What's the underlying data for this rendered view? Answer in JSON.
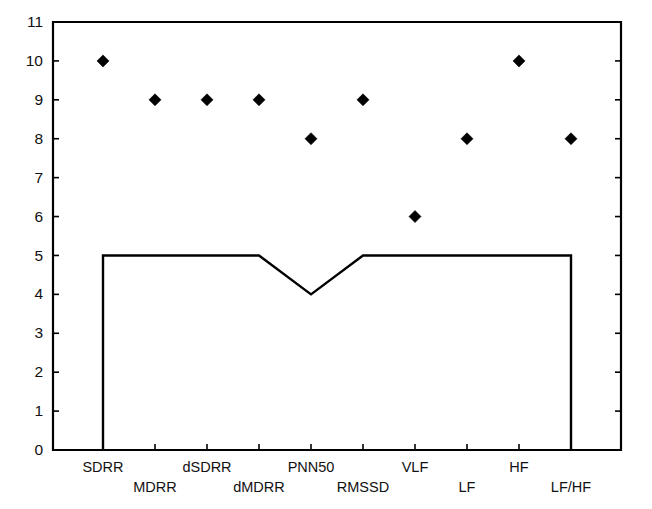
{
  "chart_data": {
    "type": "scatter",
    "title": "",
    "xlabel": "",
    "ylabel": "",
    "ylim": [
      0,
      11
    ],
    "yticks": [
      0,
      1,
      2,
      3,
      4,
      5,
      6,
      7,
      8,
      9,
      10,
      11
    ],
    "ytick_labels": [
      "0",
      "1",
      "2",
      "3",
      "4",
      "5",
      "6",
      "7",
      "8",
      "9",
      "10",
      "11"
    ],
    "grid": false,
    "legend": "none",
    "categories": [
      "SDRR",
      "MDRR",
      "dSDRR",
      "dMDRR",
      "PNN50",
      "RMSSD",
      "VLF",
      "LF",
      "HF",
      "LF/HF"
    ],
    "series": [
      {
        "name": "markers",
        "marker": "diamond",
        "color": "#000000",
        "values": [
          10,
          9,
          9,
          9,
          8,
          9,
          6,
          8,
          10,
          8
        ]
      },
      {
        "name": "threshold-step",
        "style": "line",
        "color": "#000000",
        "values": [
          5,
          5,
          5,
          5,
          4,
          5,
          5,
          5,
          5,
          5
        ],
        "baseline_drop": 0,
        "note": "line drops vertically to 0 at first and last categories"
      }
    ]
  },
  "axes": {
    "y_axis_name": "y-axis",
    "x_axis_name": "x-axis",
    "y_min_label": "0",
    "y_max_label": "11"
  },
  "xtick_labels": {
    "row_top": [
      "SDRR",
      "dSDRR",
      "PNN50",
      "VLF",
      "HF"
    ],
    "row_bottom": [
      "MDRR",
      "dMDRR",
      "RMSSD",
      "LF",
      "LF/HF"
    ]
  },
  "colors": {
    "axis": "#000000",
    "marker": "#000000",
    "line": "#000000",
    "background": "#ffffff"
  }
}
